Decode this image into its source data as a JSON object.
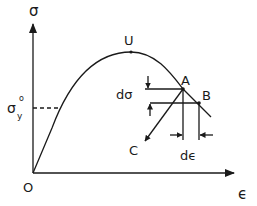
{
  "diagram": {
    "axes": {
      "y_label": "σ",
      "x_label": "ϵ",
      "origin_label": "O"
    },
    "points": {
      "ultimate": "U",
      "point_a": "A",
      "point_b": "B",
      "point_c": "C"
    },
    "annotations": {
      "yield_stress": "σ",
      "yield_sub": "y",
      "yield_sup": "o",
      "d_sigma": "dσ",
      "d_epsilon": "dϵ"
    },
    "colors": {
      "ink": "#1a1a1a",
      "background": "#ffffff"
    }
  }
}
